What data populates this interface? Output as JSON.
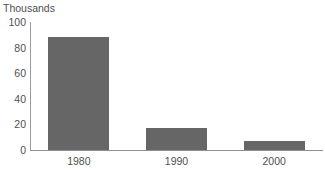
{
  "chart_data": {
    "type": "bar",
    "title": "Thousands",
    "xlabel": "",
    "ylabel": "Thousands",
    "categories": [
      "1980",
      "1990",
      "2000"
    ],
    "values": [
      88,
      17,
      7
    ],
    "series": [
      {
        "name": "Thousands",
        "values": [
          88,
          17,
          7
        ]
      }
    ],
    "ylim": [
      0,
      100
    ],
    "yticks": [
      0,
      20,
      40,
      60,
      80,
      100
    ],
    "ytick_labels": [
      "0",
      "20",
      "40",
      "60",
      "80",
      "100"
    ],
    "grid": false,
    "legend": false,
    "legend_position": "none",
    "bar_color": "#666666",
    "axis_color": "#8f8f8f",
    "text_color": "#4f4f4f",
    "background_color": "#ffffff"
  }
}
